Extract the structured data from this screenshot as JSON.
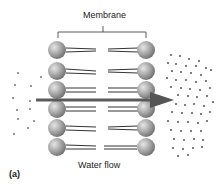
{
  "diagram": {
    "membrane_label": "Membrane",
    "flow_label": "Water flow",
    "panel_label": "(a)",
    "colors": {
      "head": "#9a9a9a",
      "head_highlight": "#e6e6e6",
      "tail": "#333333",
      "arrow": "#5a5a5a",
      "dots": "#555555"
    },
    "rows": 6
  }
}
